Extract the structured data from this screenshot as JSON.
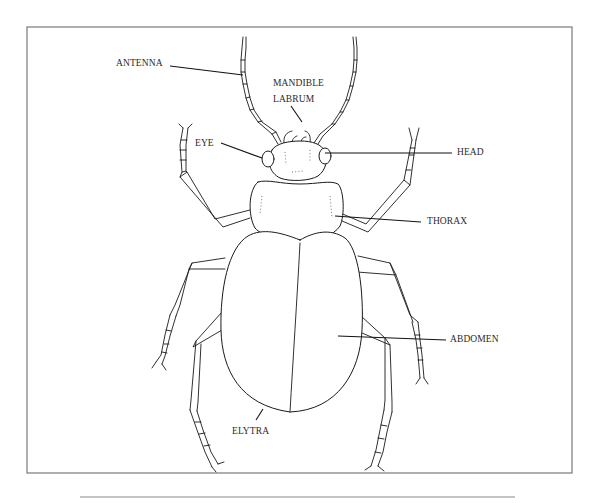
{
  "diagram": {
    "frame": {
      "x": 27,
      "y": 27,
      "width": 545,
      "height": 446
    },
    "bottom_rule": {
      "x1": 80,
      "x2": 515,
      "y": 497
    },
    "colors": {
      "line": "#1a1a1a",
      "frame": "#7a7a7a",
      "text": "#2a2a2a",
      "background": "#ffffff"
    },
    "labels": [
      {
        "id": "antenna",
        "text": "ANTENNA",
        "x": 116,
        "y": 59
      },
      {
        "id": "mandible",
        "text": "MANDIBLE",
        "x": 273,
        "y": 79
      },
      {
        "id": "labrum",
        "text": "LABRUM",
        "x": 273,
        "y": 95
      },
      {
        "id": "eye",
        "text": "EYE",
        "x": 195,
        "y": 140
      },
      {
        "id": "head",
        "text": "HEAD",
        "x": 457,
        "y": 149
      },
      {
        "id": "thorax",
        "text": "THORAX",
        "x": 427,
        "y": 217
      },
      {
        "id": "abdomen",
        "text": "ABDOMEN",
        "x": 450,
        "y": 335
      },
      {
        "id": "elytra",
        "text": "ELYTRA",
        "x": 232,
        "y": 427
      }
    ],
    "leaders": [
      {
        "id": "antenna",
        "x1": 170,
        "y1": 66,
        "x2": 243,
        "y2": 75
      },
      {
        "id": "labrum",
        "x1": 291,
        "y1": 106,
        "x2": 302,
        "y2": 122
      },
      {
        "id": "eye",
        "x1": 221,
        "y1": 143,
        "x2": 262,
        "y2": 158
      },
      {
        "id": "head",
        "x1": 325,
        "y1": 153,
        "x2": 452,
        "y2": 153
      },
      {
        "id": "thorax",
        "x1": 335,
        "y1": 216,
        "x2": 421,
        "y2": 222
      },
      {
        "id": "abdomen",
        "x1": 338,
        "y1": 336,
        "x2": 446,
        "y2": 340
      },
      {
        "id": "elytra",
        "x1": 256,
        "y1": 420,
        "x2": 263,
        "y2": 409
      }
    ]
  }
}
